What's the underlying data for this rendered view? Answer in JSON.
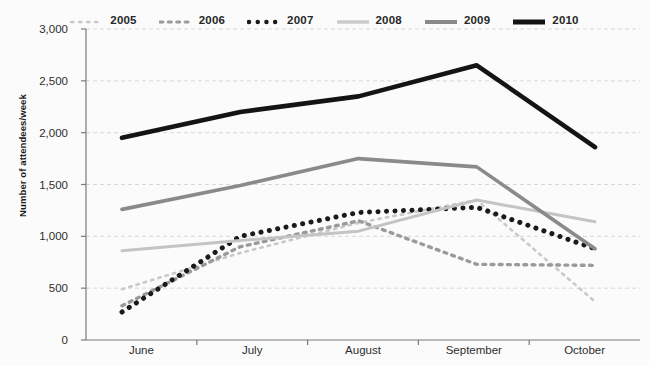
{
  "chart_data": {
    "type": "line",
    "title": "",
    "xlabel": "",
    "ylabel": "Number of attendees/week",
    "categories": [
      "June",
      "July",
      "August",
      "September",
      "October"
    ],
    "ylim": [
      0,
      3000
    ],
    "yticks": [
      0,
      500,
      1000,
      1500,
      2000,
      2500,
      3000
    ],
    "ytick_labels": [
      "0",
      "500",
      "1,000",
      "1,500",
      "2,000",
      "2,500",
      "3,000"
    ],
    "grid": true,
    "legend_position": "top-center",
    "series": [
      {
        "name": "2005",
        "values": [
          490,
          840,
          1130,
          1350,
          370
        ],
        "color": "#c9c9c9",
        "style": "dotted-fine",
        "swatch": "dotted-fine"
      },
      {
        "name": "2006",
        "values": [
          330,
          900,
          1150,
          730,
          720
        ],
        "color": "#9a9a9a",
        "style": "dotted-medium",
        "swatch": "dotted-medium"
      },
      {
        "name": "2007",
        "values": [
          270,
          1000,
          1230,
          1280,
          880
        ],
        "color": "#1a1a1a",
        "style": "dotted-bold",
        "swatch": "dotted-bold"
      },
      {
        "name": "2008",
        "values": [
          860,
          960,
          1050,
          1350,
          1140
        ],
        "color": "#c4c4c4",
        "style": "solid",
        "swatch": "solid-light"
      },
      {
        "name": "2009",
        "values": [
          1260,
          1490,
          1750,
          1670,
          880
        ],
        "color": "#8a8a8a",
        "style": "solid",
        "swatch": "solid-gray"
      },
      {
        "name": "2010",
        "values": [
          1950,
          2200,
          2350,
          2650,
          1860
        ],
        "color": "#141414",
        "style": "solid",
        "swatch": "solid-black"
      }
    ]
  },
  "axes": {
    "y_axis_color": "#7a7a7a",
    "x_axis_color": "#7a7a7a",
    "grid_color": "#d8d8d8"
  }
}
